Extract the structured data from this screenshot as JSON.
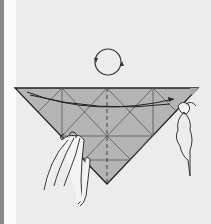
{
  "figure": {
    "type": "origami-instruction-step",
    "symbol": "turn-over-arrows",
    "colors": {
      "background": "#ececec",
      "paper": "#b4b4b4",
      "line": "#222222",
      "crease": "#555555",
      "left_strip": "#8a8a8a"
    }
  }
}
